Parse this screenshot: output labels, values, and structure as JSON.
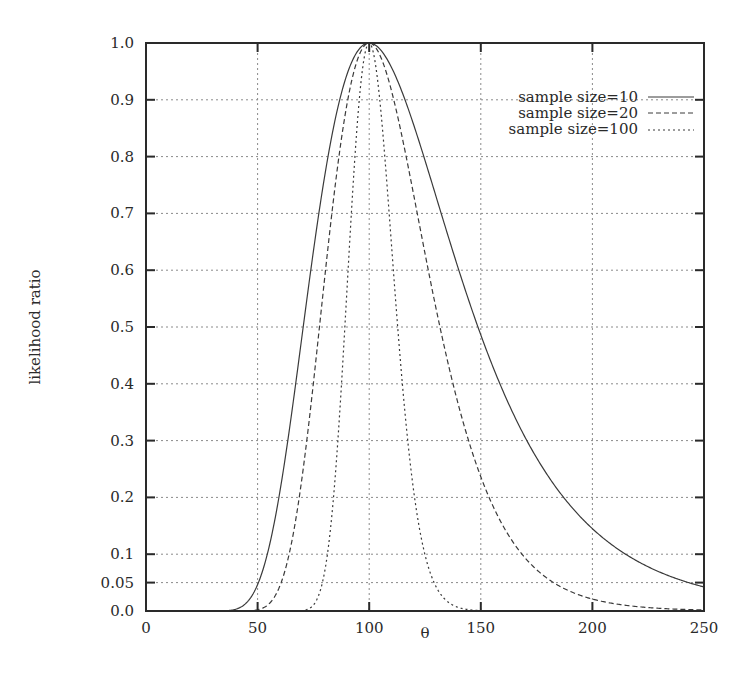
{
  "chart_data": {
    "type": "line",
    "title": "",
    "xlabel": "θ",
    "ylabel": "likelihood ratio",
    "xlim": [
      0,
      250
    ],
    "ylim": [
      0.0,
      1.0
    ],
    "grid": true,
    "legend_position": "top-right (inside)",
    "x_ticks": [
      0,
      50,
      100,
      150,
      200,
      250
    ],
    "x_tick_labels": [
      "0",
      "50",
      "100",
      "150",
      "200",
      "250"
    ],
    "y_ticks": [
      0.0,
      0.05,
      0.1,
      0.2,
      0.3,
      0.4,
      0.5,
      0.6,
      0.7,
      0.8,
      0.9,
      1.0
    ],
    "y_tick_labels": [
      "0.0",
      "0.05",
      "0.1",
      "0.2",
      "0.3",
      "0.4",
      "0.5",
      "0.6",
      "0.7",
      "0.8",
      "0.9",
      "1.0"
    ],
    "x": [
      30,
      35,
      40,
      45,
      50,
      55,
      60,
      65,
      70,
      75,
      80,
      85,
      90,
      95,
      100,
      105,
      110,
      115,
      120,
      125,
      130,
      135,
      140,
      145,
      150,
      155,
      160,
      165,
      170,
      175,
      180,
      185,
      190,
      195,
      200,
      205,
      210,
      215,
      220,
      225,
      230,
      235,
      240,
      245,
      250
    ],
    "series": [
      {
        "name": "sample size=10",
        "line_style": "solid",
        "values": [
          0.0,
          0.002,
          0.01,
          0.026,
          0.046,
          0.093,
          0.195,
          0.326,
          0.461,
          0.603,
          0.72,
          0.824,
          0.901,
          0.958,
          1.0,
          0.989,
          0.956,
          0.906,
          0.841,
          0.77,
          0.698,
          0.627,
          0.56,
          0.497,
          0.486,
          0.43,
          0.398,
          0.367,
          0.32,
          0.29,
          0.254,
          0.232,
          0.206,
          0.18,
          0.164,
          0.146,
          0.129,
          0.116,
          0.102,
          0.09,
          0.079,
          0.069,
          0.061,
          0.053,
          0.042
        ]
      },
      {
        "name": "sample size=20",
        "line_style": "dashed",
        "values": [
          0.0,
          0.0,
          0.0,
          0.001,
          0.002,
          0.009,
          0.038,
          0.106,
          0.213,
          0.364,
          0.518,
          0.679,
          0.812,
          0.918,
          1.0,
          0.978,
          0.914,
          0.821,
          0.707,
          0.593,
          0.487,
          0.393,
          0.314,
          0.247,
          0.236,
          0.185,
          0.158,
          0.135,
          0.102,
          0.084,
          0.065,
          0.054,
          0.042,
          0.032,
          0.027,
          0.021,
          0.017,
          0.013,
          0.01,
          0.008,
          0.006,
          0.005,
          0.004,
          0.003,
          0.002
        ]
      },
      {
        "name": "sample size=100",
        "line_style": "dotted",
        "values": [
          0.0,
          0.0,
          0.0,
          0.0,
          0.0,
          0.0,
          0.0,
          0.0,
          0.004,
          0.058,
          0.201,
          0.445,
          0.747,
          0.975,
          1.0,
          0.896,
          0.634,
          0.376,
          0.193,
          0.087,
          0.035,
          0.013,
          0.004,
          0.001,
          0.0,
          0.0,
          0.0,
          0.0,
          0.0,
          0.0,
          0.0,
          0.0,
          0.0,
          0.0,
          0.0,
          0.0,
          0.0,
          0.0,
          0.0,
          0.0,
          0.0,
          0.0,
          0.0,
          0.0,
          0.0
        ]
      }
    ]
  },
  "legend": {
    "items": [
      {
        "label": "sample size=10"
      },
      {
        "label": "sample size=20"
      },
      {
        "label": "sample size=100"
      }
    ]
  },
  "axes": {
    "xlabel": "θ",
    "ylabel": "likelihood ratio"
  },
  "colors": {
    "curve": "#3a3a3a",
    "grid": "#8a8a8a",
    "frame": "#2a2a2a"
  }
}
